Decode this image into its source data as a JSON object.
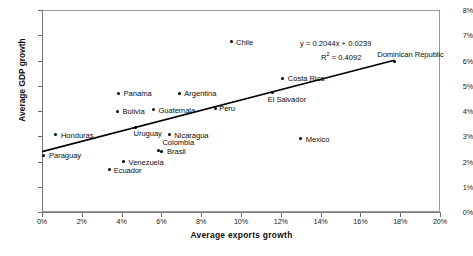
{
  "chart_data": {
    "type": "scatter",
    "title": "",
    "xlabel": "Average exports growth",
    "ylabel": "Average GDP growth",
    "xlim": [
      0,
      20
    ],
    "ylim": [
      0,
      8
    ],
    "grid": false,
    "legend": "none",
    "x_tick_labels": [
      "0%",
      "2%",
      "4%",
      "6%",
      "8%",
      "10%",
      "12%",
      "14%",
      "16%",
      "18%",
      "20%"
    ],
    "y_tick_labels": [
      "0%",
      "1%",
      "2%",
      "3%",
      "4%",
      "5%",
      "6%",
      "7%",
      "8%"
    ],
    "annotations": {
      "equation": "y = 0.2044x + 0.0239",
      "r_squared_prefix": "R",
      "r_squared_exp": "2",
      "r_squared_value": " = 0.4092",
      "slope": 0.2044,
      "intercept": 0.0239,
      "r2": 0.4092
    },
    "trendline": {
      "type": "linear",
      "x_start": 0,
      "y_start": 2.39,
      "x_end": 17.7,
      "y_end": 6.01
    },
    "points": [
      {
        "name": "Paraguay",
        "x": 0.1,
        "y": 2.25,
        "label_dx": 5,
        "label_dy": -4
      },
      {
        "name": "Honduras",
        "x": 0.7,
        "y": 3.05,
        "label_dx": 5,
        "label_dy": -4
      },
      {
        "name": "Ecuador",
        "x": 3.4,
        "y": 1.7,
        "label_dx": 4,
        "label_dy": -3
      },
      {
        "name": "Bolivia",
        "x": 3.8,
        "y": 4.0,
        "label_dx": 5,
        "label_dy": -4
      },
      {
        "name": "Panama",
        "x": 3.85,
        "y": 4.7,
        "label_dx": 5,
        "label_dy": -4
      },
      {
        "name": "Venezuela",
        "x": 4.1,
        "y": 2.0,
        "label_dx": 5,
        "label_dy": -4
      },
      {
        "name": "Uruguay",
        "x": 4.7,
        "y": 3.35,
        "label_dx": -2,
        "label_dy": 2
      },
      {
        "name": "Guatemala",
        "x": 5.6,
        "y": 4.05,
        "label_dx": 5,
        "label_dy": -4
      },
      {
        "name": "Colombia",
        "x": 5.85,
        "y": 2.42,
        "label_dx": 0,
        "label_dy": -13
      },
      {
        "name": "Brasil",
        "x": 5.98,
        "y": 2.4,
        "label_dx": 6,
        "label_dy": -4
      },
      {
        "name": "Nicaragua",
        "x": 6.4,
        "y": 3.05,
        "label_dx": 5,
        "label_dy": -4
      },
      {
        "name": "Argentina",
        "x": 6.9,
        "y": 4.7,
        "label_dx": 5,
        "label_dy": -4
      },
      {
        "name": "Peru",
        "x": 8.7,
        "y": 4.1,
        "label_dx": 4,
        "label_dy": 0
      },
      {
        "name": "Chile",
        "x": 9.5,
        "y": 6.75,
        "label_dx": 5,
        "label_dy": -4
      },
      {
        "name": "El Salvador",
        "x": 11.6,
        "y": 4.75,
        "label_dx": -5,
        "label_dy": 3
      },
      {
        "name": "Costa Rica",
        "x": 12.1,
        "y": 5.3,
        "label_dx": 5,
        "label_dy": -4
      },
      {
        "name": "Mexico",
        "x": 13.0,
        "y": 2.9,
        "label_dx": 5,
        "label_dy": -4
      },
      {
        "name": "Dominican Republic",
        "x": 17.7,
        "y": 5.95,
        "label_dx": -17,
        "label_dy": -12
      }
    ]
  }
}
